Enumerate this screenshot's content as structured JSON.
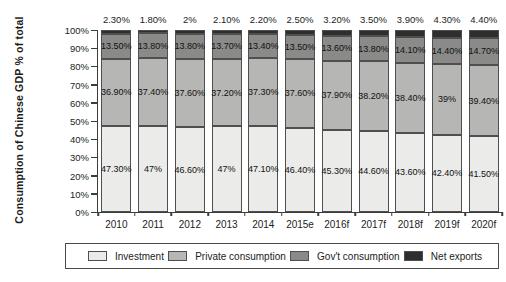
{
  "chart_data": {
    "type": "bar",
    "stacked": true,
    "title": "",
    "ylabel": "Consumption of Chinese GDP % of total",
    "xlabel": "",
    "ylim": [
      0,
      100
    ],
    "grid": false,
    "legend_position": "bottom",
    "y_ticks": [
      "0%",
      "10%",
      "20%",
      "30%",
      "40%",
      "50%",
      "60%",
      "70%",
      "80%",
      "90%",
      "100%"
    ],
    "categories": [
      "2010",
      "2011",
      "2012",
      "2013",
      "2014",
      "2015e",
      "2016f",
      "2017f",
      "2018f",
      "2019f",
      "2020f"
    ],
    "series": [
      {
        "name": "Investment",
        "color": "#ebebe9",
        "values": [
          47.3,
          47,
          46.6,
          47,
          47.1,
          46.4,
          45.3,
          44.6,
          43.6,
          42.4,
          41.5
        ],
        "labels": [
          "47.30%",
          "47%",
          "46.60%",
          "47%",
          "47.10%",
          "46.40%",
          "45.30%",
          "44.60%",
          "43.60%",
          "42.40%",
          "41.50%"
        ]
      },
      {
        "name": "Private consumption",
        "color": "#b6b6b4",
        "values": [
          36.9,
          37.4,
          37.6,
          37.2,
          37.3,
          37.6,
          37.9,
          38.2,
          38.4,
          39,
          39.4
        ],
        "labels": [
          "36.90%",
          "37.40%",
          "37.60%",
          "37.20%",
          "37.30%",
          "37.60%",
          "37.90%",
          "38.20%",
          "38.40%",
          "39%",
          "39.40%"
        ]
      },
      {
        "name": "Gov't consumption",
        "color": "#8a8a88",
        "values": [
          13.5,
          13.8,
          13.8,
          13.7,
          13.4,
          13.5,
          13.6,
          13.8,
          14.1,
          14.4,
          14.7
        ],
        "labels": [
          "13.50%",
          "13.80%",
          "13.80%",
          "13.70%",
          "13.40%",
          "13.50%",
          "13.60%",
          "13.80%",
          "14.10%",
          "14.40%",
          "14.70%"
        ]
      },
      {
        "name": "Net exports",
        "color": "#2e2e2e",
        "values": [
          2.3,
          1.8,
          2,
          2.1,
          2.2,
          2.5,
          3.2,
          3.5,
          3.9,
          4.3,
          4.4
        ],
        "labels": [
          "2.30%",
          "1.80%",
          "2%",
          "2.10%",
          "2.20%",
          "2.50%",
          "3.20%",
          "3.50%",
          "3.90%",
          "4.30%",
          "4.40%"
        ]
      }
    ],
    "colors": {
      "axis": "#3c3c3c",
      "text": "#1c1c1c",
      "segment_border": "#4f4f4f",
      "background": "#ffffff"
    }
  }
}
